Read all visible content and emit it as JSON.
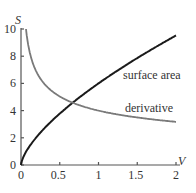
{
  "chart_data": {
    "type": "line",
    "title": "",
    "xlabel": "V",
    "ylabel": "S",
    "xlim": [
      0,
      2
    ],
    "ylim": [
      0,
      10
    ],
    "x_ticks": [
      "0",
      "0.5",
      "1",
      "1.5",
      "2"
    ],
    "y_ticks": [
      "0",
      "2",
      "4",
      "6",
      "8",
      "10"
    ],
    "grid": false,
    "legend": "inline labels",
    "series": [
      {
        "name": "surface area",
        "formula": "S = 6V^(2/3)",
        "color": "#1a1a1a",
        "x": [
          0,
          0.1,
          0.25,
          0.5,
          0.667,
          1,
          1.5,
          2
        ],
        "values": [
          0,
          1.29,
          2.38,
          3.78,
          4.58,
          6.0,
          7.86,
          9.52
        ]
      },
      {
        "name": "derivative",
        "formula": "dS/dV = 4V^(-1/3)",
        "color": "#7a7a7a",
        "x": [
          0.064,
          0.1,
          0.25,
          0.5,
          0.667,
          1,
          1.5,
          2
        ],
        "values": [
          10.0,
          8.62,
          6.35,
          5.04,
          4.58,
          4.0,
          3.49,
          3.17
        ]
      }
    ]
  },
  "labels": {
    "ylabel": "S",
    "xlabel": "V",
    "surface": "surface area",
    "derivative": "derivative",
    "xt": [
      "0",
      "0.5",
      "1",
      "1.5",
      "2"
    ],
    "yt": [
      "0",
      "2",
      "4",
      "6",
      "8",
      "10"
    ]
  }
}
